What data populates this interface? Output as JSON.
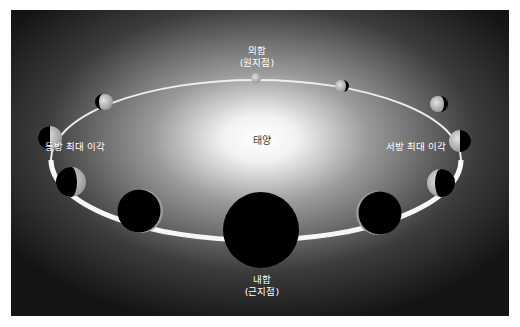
{
  "diagram": {
    "type": "orbital-phase-diagram",
    "colors": {
      "background_edge": "#141414",
      "sun_glow_center": "#ffffff",
      "orbit_line": "#f2f2f2",
      "planet_night": "#000000",
      "planet_day": "#bdbdbd",
      "label_light": "#ffffff",
      "label_dark": "#3a3a3a"
    },
    "center": {
      "label": "태양"
    },
    "labels": {
      "superior_conjunction": {
        "line1": "외합",
        "line2": "(원지점)"
      },
      "inferior_conjunction": {
        "line1": "내합",
        "line2": "(근지점)"
      },
      "greatest_eastern_elongation": "동방 최대 이각",
      "greatest_western_elongation": "서방 최대 이각"
    },
    "planets": [
      {
        "id": "p-top",
        "cx": 245,
        "cy": 68,
        "r": 5,
        "phase": "full"
      },
      {
        "id": "p-top-right",
        "cx": 330,
        "cy": 76,
        "r": 6,
        "phase": "gibbous-right-dark"
      },
      {
        "id": "p-top-left",
        "cx": 94,
        "cy": 92,
        "r": 8,
        "phase": "gibbous-left-dark"
      },
      {
        "id": "p-right-upper",
        "cx": 427,
        "cy": 94,
        "r": 8,
        "phase": "gibbous-right-dark"
      },
      {
        "id": "p-left",
        "cx": 39,
        "cy": 128,
        "r": 12,
        "phase": "half-left-dark"
      },
      {
        "id": "p-right",
        "cx": 449,
        "cy": 131,
        "r": 11,
        "phase": "half-right-dark"
      },
      {
        "id": "p-left-lower",
        "cx": 60,
        "cy": 172,
        "r": 15,
        "phase": "crescent-left"
      },
      {
        "id": "p-right-lower",
        "cx": 430,
        "cy": 173,
        "r": 14,
        "phase": "crescent-right"
      },
      {
        "id": "p-bottom-left",
        "cx": 130,
        "cy": 201,
        "r": 22,
        "phase": "thin-crescent-left"
      },
      {
        "id": "p-bottom-right",
        "cx": 367,
        "cy": 203,
        "r": 22,
        "phase": "thin-crescent-right"
      },
      {
        "id": "p-bottom",
        "cx": 250,
        "cy": 220,
        "r": 38,
        "phase": "new"
      }
    ]
  }
}
